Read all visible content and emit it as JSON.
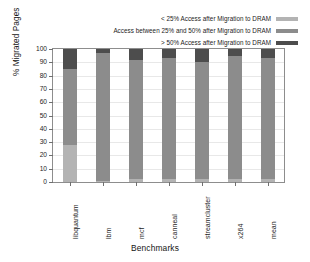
{
  "chart_data": {
    "type": "bar",
    "subtype": "stacked-bar",
    "title": "",
    "xlabel": "Benchmarks",
    "ylabel": "% Migrated Pages",
    "ylim": [
      0,
      100
    ],
    "yticks": [
      0,
      10,
      20,
      30,
      40,
      50,
      60,
      70,
      80,
      90,
      100
    ],
    "ytick_labels": [
      "0",
      "10",
      "20",
      "30",
      "40",
      "50",
      "60",
      "70",
      "80",
      "90",
      "100"
    ],
    "grid": true,
    "legend_position": "top-right",
    "categories": [
      "libquantum",
      "lbm",
      "mcf",
      "canneal",
      "streamcluster",
      "x264",
      "mean"
    ],
    "series": [
      {
        "name": "< 25% Access after Migration to DRAM",
        "color": "#b3b3b3",
        "values": [
          28,
          1,
          2,
          2,
          2,
          2,
          2
        ]
      },
      {
        "name": "Access between 25% and 50% after Migration to DRAM",
        "color": "#8c8c8c",
        "values": [
          57,
          96,
          90,
          91,
          88,
          93,
          91
        ]
      },
      {
        "name": "> 50% Access after Migration to DRAM",
        "color": "#4d4d4d",
        "values": [
          15,
          3,
          8,
          7,
          10,
          5,
          7
        ]
      }
    ],
    "legend": [
      {
        "label": "< 25% Access after Migration to DRAM",
        "color": "#b3b3b3"
      },
      {
        "label": "Access between 25% and 50% after Migration to DRAM",
        "color": "#8c8c8c"
      },
      {
        "label": "> 50% Access after Migration to DRAM",
        "color": "#4d4d4d"
      }
    ]
  }
}
